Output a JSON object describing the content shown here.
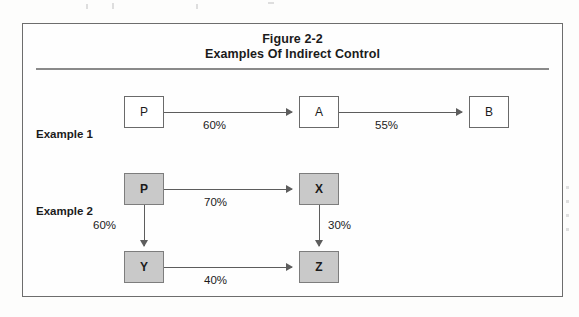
{
  "figure": {
    "title_line_1": "Figure 2-2",
    "title_line_2": "Examples Of Indirect Control"
  },
  "rows": {
    "example_1_label": "Example 1",
    "example_2_label": "Example 2"
  },
  "nodes": {
    "p1": "P",
    "a": "A",
    "b": "B",
    "p2": "P",
    "x": "X",
    "y": "Y",
    "z": "Z"
  },
  "edges": {
    "p1_to_a": "60%",
    "a_to_b": "55%",
    "p2_to_x": "70%",
    "p2_to_y": "60%",
    "x_to_z": "30%",
    "y_to_z": "40%"
  },
  "colors": {
    "frame_border": "#6d6d6d",
    "rule": "#8a8a8a",
    "node_border": "#6a6a6a",
    "node_plain_fill": "#ffffff",
    "node_shaded_fill": "#c9c9c9",
    "arrow": "#5d5d5d",
    "text": "#1b1b1b"
  }
}
